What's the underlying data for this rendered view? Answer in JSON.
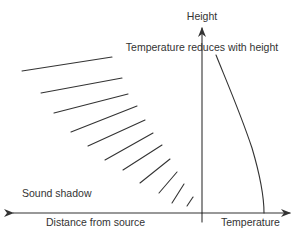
{
  "diagram": {
    "labels": {
      "height_axis": "Height",
      "temperature_note": "Temperature reduces with height",
      "sound_shadow": "Sound shadow",
      "distance_axis": "Distance from source",
      "temperature_axis": "Temperature"
    },
    "colors": {
      "line": "#333333",
      "text": "#333333",
      "background": "#ffffff"
    },
    "sound_rays": [
      {
        "x1": 22,
        "y1": 71,
        "x2": 112,
        "y2": 57
      },
      {
        "x1": 41,
        "y1": 93,
        "x2": 122,
        "y2": 78
      },
      {
        "x1": 54,
        "y1": 113,
        "x2": 128,
        "y2": 94
      },
      {
        "x1": 71,
        "y1": 132,
        "x2": 137,
        "y2": 106
      },
      {
        "x1": 88,
        "y1": 146,
        "x2": 145,
        "y2": 120
      },
      {
        "x1": 105,
        "y1": 160,
        "x2": 153,
        "y2": 133
      },
      {
        "x1": 123,
        "y1": 170,
        "x2": 162,
        "y2": 145
      },
      {
        "x1": 140,
        "y1": 183,
        "x2": 170,
        "y2": 159
      },
      {
        "x1": 159,
        "y1": 193,
        "x2": 177,
        "y2": 172
      },
      {
        "x1": 172,
        "y1": 203,
        "x2": 184,
        "y2": 184
      },
      {
        "x1": 187,
        "y1": 206,
        "x2": 193,
        "y2": 197
      }
    ],
    "temperature_curve": "M216,55 C226,80 240,112 252,148 C260,175 264,195 264,213"
  }
}
